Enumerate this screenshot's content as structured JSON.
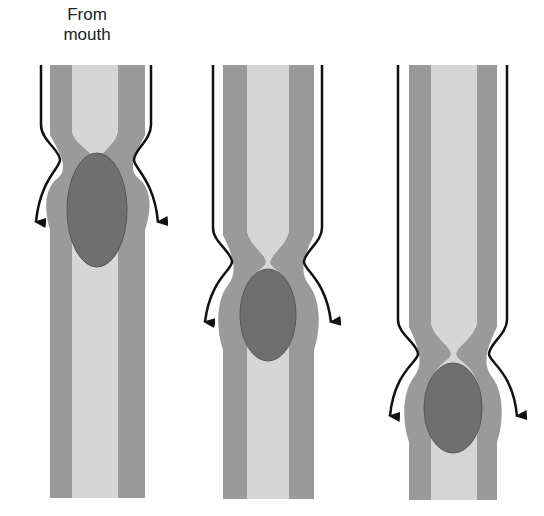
{
  "figure": {
    "label_from_mouth": "From mouth",
    "label_line1": "From",
    "label_line2": "mouth",
    "panels": [
      {
        "id": "stage-1",
        "constriction_y": 160,
        "bolus": {
          "cx": 97,
          "cy": 210,
          "rx": 30,
          "ry": 57
        }
      },
      {
        "id": "stage-2",
        "constriction_y": 262,
        "bolus": {
          "cx": 268,
          "cy": 315,
          "rx": 28,
          "ry": 46
        }
      },
      {
        "id": "stage-3",
        "constriction_y": 354,
        "bolus": {
          "cx": 453,
          "cy": 408,
          "rx": 29,
          "ry": 45
        }
      }
    ],
    "colors": {
      "muscle_wall": "#9a9a9a",
      "lumen": "#d6d6d6",
      "bolus": "#6f6f6f",
      "outline": "#111111",
      "background": "#ffffff"
    }
  }
}
